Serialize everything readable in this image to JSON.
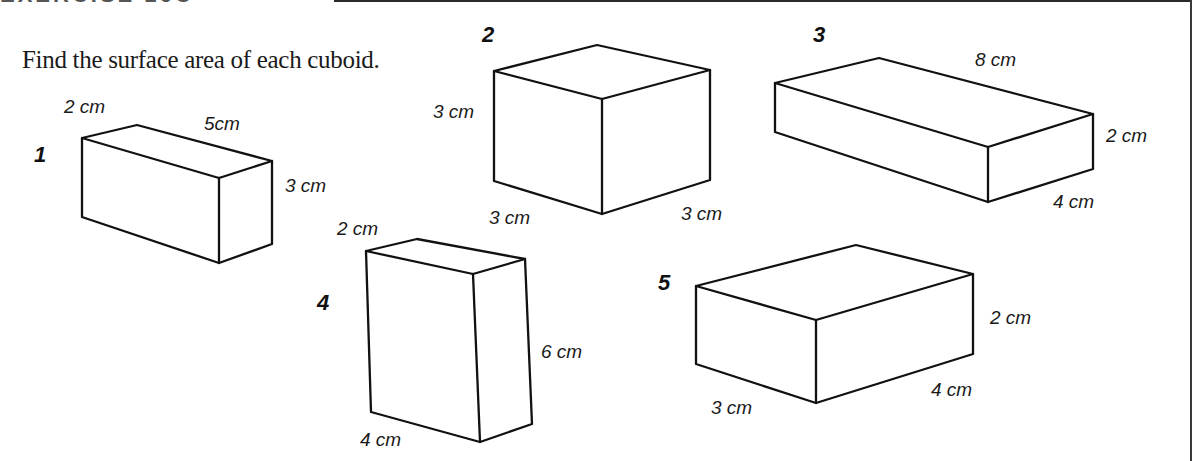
{
  "header": {
    "title": "EXERCISE 16C",
    "rule_color": "#2a2a2a"
  },
  "instruction": "Find the surface area of each cuboid.",
  "cuboids": [
    {
      "number": "1",
      "number_pos": [
        34,
        144
      ],
      "vertices": {
        "tl": [
          82,
          138
        ],
        "tb": [
          137,
          125
        ],
        "tr": [
          272,
          161
        ],
        "tf": [
          219,
          178
        ],
        "bl": [
          82,
          217
        ],
        "bf": [
          219,
          263
        ],
        "br": [
          272,
          244
        ]
      },
      "labels": [
        {
          "text": "2  cm",
          "pos": [
            64,
            97
          ]
        },
        {
          "text": "5cm",
          "pos": [
            204,
            114
          ]
        },
        {
          "text": "3 cm",
          "pos": [
            285,
            176
          ]
        }
      ]
    },
    {
      "number": "2",
      "number_pos": [
        482,
        24
      ],
      "vertices": {
        "tl": [
          494,
          71
        ],
        "tb": [
          597,
          45
        ],
        "tr": [
          710,
          70
        ],
        "tf": [
          602,
          99
        ],
        "bl": [
          494,
          181
        ],
        "bf": [
          602,
          214
        ],
        "br": [
          710,
          180
        ]
      },
      "labels": [
        {
          "text": "3 cm",
          "pos": [
            433,
            102
          ]
        },
        {
          "text": "3 cm",
          "pos": [
            489,
            208
          ]
        },
        {
          "text": "3 cm",
          "pos": [
            681,
            204
          ]
        }
      ]
    },
    {
      "number": "3",
      "number_pos": [
        813,
        24
      ],
      "vertices": {
        "tl": [
          775,
          83
        ],
        "tb": [
          879,
          58
        ],
        "tr": [
          1093,
          114
        ],
        "tf": [
          988,
          147
        ],
        "bl": [
          775,
          132
        ],
        "bf": [
          988,
          202
        ],
        "br": [
          1093,
          169
        ]
      },
      "labels": [
        {
          "text": "8 cm",
          "pos": [
            975,
            50
          ]
        },
        {
          "text": "2 cm",
          "pos": [
            1106,
            126
          ]
        },
        {
          "text": "4 cm",
          "pos": [
            1053,
            192
          ]
        }
      ]
    },
    {
      "number": "4",
      "number_pos": [
        317,
        292
      ],
      "vertices": {
        "tl": [
          366,
          251
        ],
        "tb": [
          417,
          239
        ],
        "tr": [
          525,
          259
        ],
        "tf": [
          473,
          274
        ],
        "bl": [
          371,
          412
        ],
        "bf": [
          480,
          442
        ],
        "br": [
          532,
          424
        ]
      },
      "labels": [
        {
          "text": "2 cm",
          "pos": [
            337,
            219
          ]
        },
        {
          "text": "6 cm",
          "pos": [
            541,
            342
          ]
        },
        {
          "text": "4 cm",
          "pos": [
            360,
            430
          ]
        }
      ]
    },
    {
      "number": "5",
      "number_pos": [
        658,
        272
      ],
      "vertices": {
        "tl": [
          696,
          286
        ],
        "tb": [
          856,
          245
        ],
        "tr": [
          973,
          274
        ],
        "tf": [
          816,
          320
        ],
        "bl": [
          696,
          364
        ],
        "bf": [
          816,
          403
        ],
        "br": [
          973,
          354
        ]
      },
      "labels": [
        {
          "text": "2 cm",
          "pos": [
            990,
            308
          ]
        },
        {
          "text": "4 cm",
          "pos": [
            931,
            380
          ]
        },
        {
          "text": "3 cm",
          "pos": [
            711,
            398
          ]
        }
      ]
    }
  ]
}
